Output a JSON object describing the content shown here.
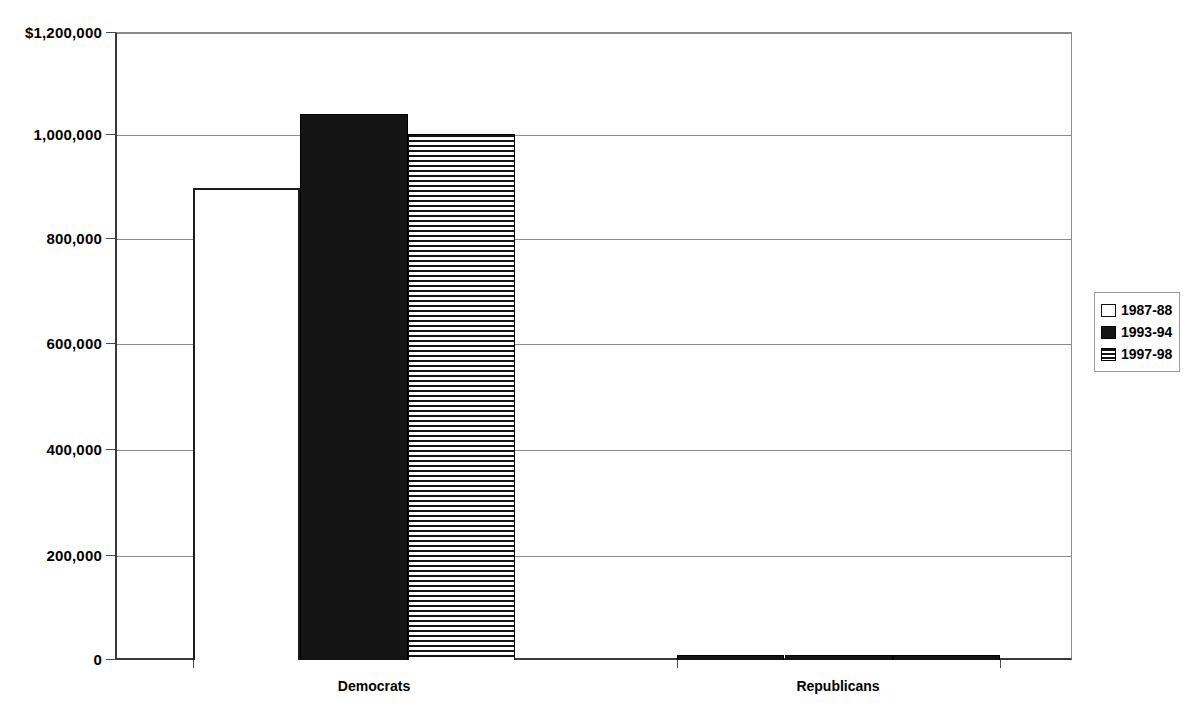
{
  "chart_data": {
    "type": "bar",
    "title": "",
    "subtitle": "",
    "xlabel": "",
    "ylabel": "",
    "categories": [
      "Democrats",
      "Republicans"
    ],
    "series": [
      {
        "name": "1987-88",
        "style": "open",
        "values": [
          901000,
          9000
        ]
      },
      {
        "name": "1993-94",
        "style": "solid",
        "values": [
          1043000,
          9000
        ]
      },
      {
        "name": "1997-98",
        "style": "striped",
        "values": [
          1005000,
          9000
        ]
      }
    ],
    "ylim": [
      0,
      1200000
    ],
    "ytick_values": [
      0,
      200000,
      400000,
      600000,
      800000,
      1000000,
      1200000
    ],
    "ytick_labels": [
      "0",
      "200,000",
      "400,000",
      "600,000",
      "800,000",
      "1,000,000",
      "$1,200,000"
    ],
    "grid": true,
    "grid_axis": "y",
    "legend_position": "right",
    "legend_entries": [
      "1987-88",
      "1993-94",
      "1997-98"
    ],
    "annotations": [],
    "colors": {
      "series_open_fill": "#ffffff",
      "series_open_edge": "#1c1c1c",
      "series_solid_fill": "#141414",
      "series_striped_fill": "#ffffff",
      "series_striped_stripe": "#141414",
      "gridline": "#8c8c8c",
      "axis": "#3a3a3a",
      "text": "#000000",
      "background": "#ffffff"
    }
  }
}
